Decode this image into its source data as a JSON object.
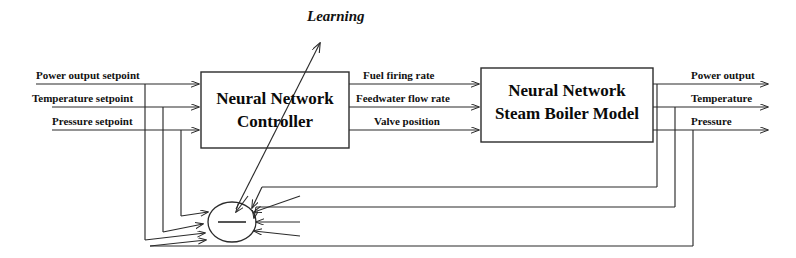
{
  "diagram": {
    "line_color": "#2b2b2b",
    "text_color": "#0a0a0a",
    "background": "#ffffff"
  },
  "annotations": {
    "learning": "Learning"
  },
  "blocks": [
    {
      "id": "controller",
      "line1": "Neural Network",
      "line2": "Controller"
    },
    {
      "id": "plant",
      "line1": "Neural Network",
      "line2": "Steam Boiler Model"
    }
  ],
  "inputs": [
    {
      "label": "Power output setpoint"
    },
    {
      "label": "Temperature setpoint"
    },
    {
      "label": "Pressure setpoint"
    }
  ],
  "intermediate_signals": [
    {
      "label": "Fuel firing rate"
    },
    {
      "label": "Feedwater flow rate"
    },
    {
      "label": "Valve position"
    }
  ],
  "outputs": [
    {
      "label": "Power output"
    },
    {
      "label": "Temperature"
    },
    {
      "label": "Pressure"
    }
  ],
  "summing_junction": {
    "sign": "−",
    "name": "error-summing-junction"
  }
}
